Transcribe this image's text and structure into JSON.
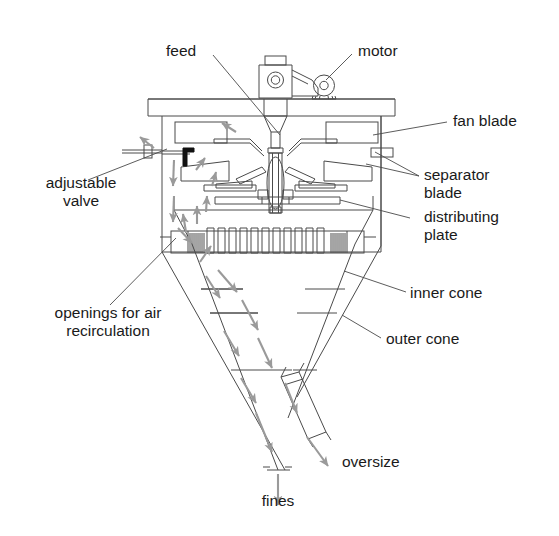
{
  "figure": {
    "type": "technical-diagram",
    "background_color": "#ffffff",
    "line_color": "#4a4a4a",
    "arrow_color": "#9a9a9a",
    "valve_color": "#111111",
    "text_color": "#1a1a1a"
  },
  "labels": {
    "feed": "feed",
    "motor": "motor",
    "fan_blade": "fan blade",
    "separator_blade": "separator\nblade",
    "distributing_plate": "distributing\nplate",
    "adjustable_valve": "adjustable\nvalve",
    "openings": "openings for air\nrecirculation",
    "inner_cone": "inner cone",
    "outer_cone": "outer cone",
    "oversize": "oversize",
    "fines": "fines"
  },
  "components": [
    {
      "name": "feed",
      "kind": "inlet-funnel"
    },
    {
      "name": "motor",
      "kind": "drive-motor"
    },
    {
      "name": "fan-blade",
      "kind": "rotating-blade"
    },
    {
      "name": "separator-blade",
      "kind": "rotating-blade"
    },
    {
      "name": "distributing-plate",
      "kind": "rotating-plate"
    },
    {
      "name": "adjustable-valve",
      "kind": "valve"
    },
    {
      "name": "air-recirculation-openings",
      "kind": "louvered-band"
    },
    {
      "name": "inner-cone",
      "kind": "cone"
    },
    {
      "name": "outer-cone",
      "kind": "cone"
    },
    {
      "name": "oversize-outlet",
      "kind": "discharge-chute"
    },
    {
      "name": "fines-outlet",
      "kind": "discharge-outlet"
    }
  ],
  "flows": [
    {
      "name": "fines",
      "direction": "down",
      "outlet": "bottom-centre"
    },
    {
      "name": "oversize",
      "direction": "down-right",
      "outlet": "side-chute"
    },
    {
      "name": "recirculating-air",
      "direction": "down-outer-up-inner"
    }
  ]
}
